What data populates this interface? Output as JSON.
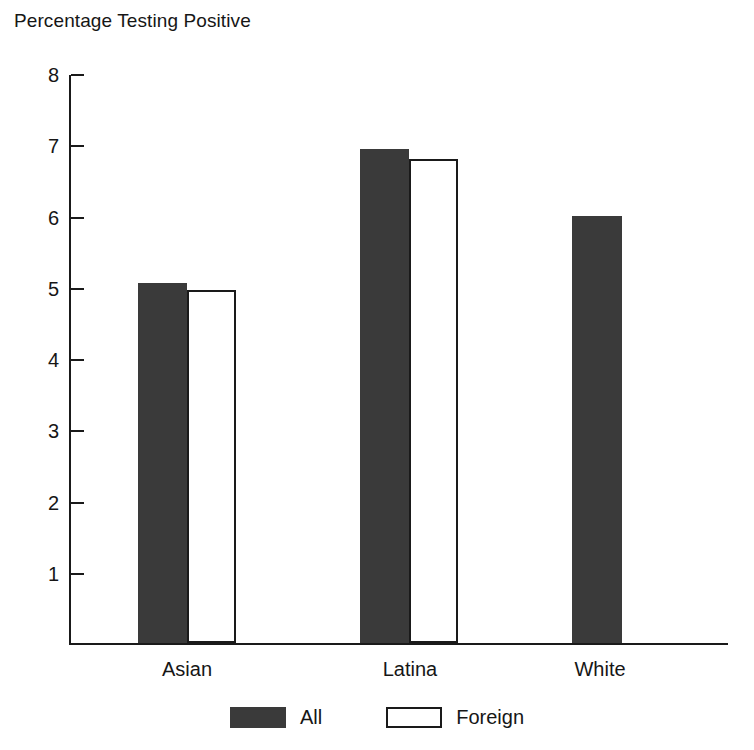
{
  "chart_data": {
    "type": "bar",
    "title": "Percentage Testing Positive",
    "title_line1": "Percentage",
    "title_line2": "Testing Positive",
    "xlabel": "",
    "ylabel": "Percentage Testing Positive",
    "categories": [
      "Asian",
      "Latina",
      "White"
    ],
    "series": [
      {
        "name": "All",
        "values": [
          5.05,
          6.93,
          6.0
        ],
        "color": "#3a3a3a"
      },
      {
        "name": "Foreign",
        "values": [
          4.95,
          6.8,
          null
        ],
        "color": "#ffffff"
      }
    ],
    "ylim": [
      0,
      8
    ],
    "yticks": [
      8,
      7,
      6,
      5,
      4,
      3,
      2,
      1
    ],
    "ytick_labels": [
      "8",
      "7",
      "6",
      "5",
      "4",
      "3",
      "2",
      "1"
    ],
    "grid": false,
    "legend_position": "bottom-center",
    "legend": [
      "All",
      "Foreign"
    ],
    "axis_color": "#1a1a1a",
    "background": "#ffffff"
  },
  "legend": {
    "items": [
      {
        "label": "All",
        "swatch": "filled-dark-swatch"
      },
      {
        "label": "Foreign",
        "swatch": "outlined-white-swatch"
      }
    ]
  }
}
